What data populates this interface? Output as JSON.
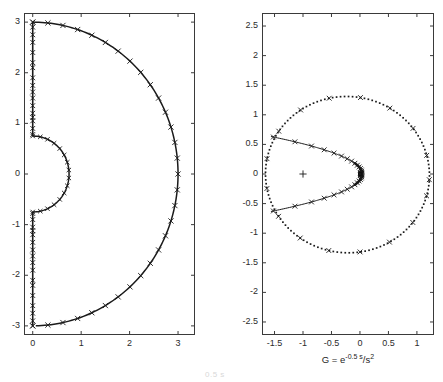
{
  "figure": {
    "width": 443,
    "height": 382,
    "background": "#ffffff",
    "line_color": "#1a1a1a",
    "axis_color": "#3a3a3a"
  },
  "left_panel": {
    "name": "nyquist-contour-s-plane",
    "box": {
      "x": 24,
      "y": 13,
      "width": 171,
      "height": 322
    },
    "xlim": [
      -0.18,
      3.35
    ],
    "ylim": [
      -3.18,
      3.18
    ],
    "xticks": [
      0,
      1,
      2,
      3
    ],
    "xtick_labels": [
      "0",
      "1",
      "2",
      "3"
    ],
    "yticks": [
      -3,
      -2,
      -1,
      0,
      1,
      2,
      3
    ],
    "ytick_labels": [
      "-3",
      "-2",
      "-1",
      "0",
      "1",
      "2",
      "3"
    ],
    "xlabel": "",
    "ylabel": "",
    "title": ""
  },
  "right_panel": {
    "name": "nyquist-plot-g-plane",
    "box": {
      "x": 262,
      "y": 13,
      "width": 172,
      "height": 322
    },
    "xlim": [
      -1.72,
      1.3
    ],
    "ylim": [
      -2.72,
      2.72
    ],
    "xticks": [
      -1.5,
      -1,
      -0.5,
      0,
      0.5,
      1
    ],
    "xtick_labels": [
      "-1.5",
      "-1",
      "-0.5",
      "0",
      "0.5",
      "1"
    ],
    "yticks": [
      -2.5,
      -2,
      -1.5,
      -1,
      -0.5,
      0,
      0.5,
      1,
      1.5,
      2,
      2.5
    ],
    "ytick_labels": [
      "-2.5",
      "-2",
      "-1.5",
      "-1",
      "-0.5",
      "0",
      "0.5",
      "1",
      "1.5",
      "2",
      "2.5"
    ],
    "xlabel_parts": {
      "lead": "G = e",
      "exponent": "-0.5 s",
      "denominator_slash": "/",
      "denominator": "s",
      "denominator_power": "2"
    },
    "xlabel_plain": "G = e^(-0.5 s)/s^2",
    "critical_point_marker": "plus",
    "critical_point": [
      -1,
      0
    ]
  },
  "footer": {
    "clipped_caption": "0.5 s"
  },
  "chart_data": [
    {
      "type": "line",
      "name": "s-plane-nyquist-contour",
      "title": "",
      "xlabel": "",
      "ylabel": "",
      "xlim": [
        -0.18,
        3.35
      ],
      "ylim": [
        -3.18,
        3.18
      ],
      "grid": false,
      "legend": "none",
      "marker": "x",
      "series": [
        {
          "name": "outer-semicircle-radius-3",
          "description": "Large right-half-plane semicircle of radius 3 centered at origin, traversed from (0,3) through (3,0) to (0,-3)",
          "radius": 3,
          "center": [
            0,
            0
          ],
          "angle_range_deg": [
            90,
            -90
          ]
        },
        {
          "name": "inner-semicircle-radius-0.75",
          "description": "Small indentation semicircle of radius 0.75 around the double pole at the origin, from (0,0.75) through (0.75,0) to (0,-0.75)",
          "radius": 0.75,
          "center": [
            0,
            0
          ],
          "angle_range_deg": [
            90,
            -90
          ]
        },
        {
          "name": "imaginary-axis-upper",
          "description": "Vertical segment on the imaginary axis from (0,0.75) up to (0,3)",
          "x": [
            0,
            0
          ],
          "y": [
            0.75,
            3
          ]
        },
        {
          "name": "imaginary-axis-lower",
          "description": "Vertical segment on the imaginary axis from (0,-3) up to (0,-0.75)",
          "x": [
            0,
            0
          ],
          "y": [
            -3,
            -0.75
          ]
        }
      ]
    },
    {
      "type": "line",
      "name": "g-plane-nyquist-image",
      "title": "",
      "xlabel": "G = e^(-0.5 s)/s^2",
      "ylabel": "",
      "xlim": [
        -1.72,
        1.3
      ],
      "ylim": [
        -2.72,
        2.72
      ],
      "grid": false,
      "legend": "none",
      "series": [
        {
          "name": "mapped-large-semicircle",
          "style": "dotted",
          "description": "Image of the large semicircle: a large closed loop passing near (1.22,0), (0.1,1.31), (-1.65,0.05), (-0.15,-1.33)"
        },
        {
          "name": "mapped-imaginary-axis",
          "style": "solid-with-x-markers",
          "description": "Image of the imaginary axis: cusped curve from (-1.62,0.64) sweeping right to a cusp near (0.06,0) and back out to (-1.62,-0.64)"
        },
        {
          "name": "critical-point",
          "style": "plus-marker",
          "points": [
            [
              -1,
              0
            ]
          ]
        }
      ]
    }
  ]
}
